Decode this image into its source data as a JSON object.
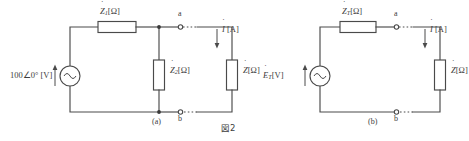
{
  "figure": {
    "caption": "図2",
    "background_color": "#ffffff",
    "line_color": "#4a4a4a",
    "text_color": "#3c3c3c"
  },
  "circuit_a": {
    "sublabel": "(a)",
    "source": {
      "value": "100∠0°",
      "unit": "[V]",
      "symbol": "ac-source",
      "polarity_arrow": "up"
    },
    "series_impedance": {
      "symbol": "Z",
      "subscript": "1",
      "unit": "[Ω]"
    },
    "shunt_impedance": {
      "symbol": "Z",
      "subscript": "2",
      "unit": "[Ω]"
    },
    "load_impedance": {
      "symbol": "Z",
      "subscript": "",
      "unit": "[Ω]"
    },
    "current": {
      "symbol": "I",
      "unit": "[A]",
      "direction": "down"
    },
    "terminals": [
      {
        "name": "a",
        "position": "top"
      },
      {
        "name": "b",
        "position": "bottom"
      }
    ]
  },
  "circuit_b": {
    "sublabel": "(b)",
    "source": {
      "symbol": "E",
      "subscript": "T",
      "unit": "[V]",
      "type": "ac-source",
      "polarity_arrow": "up"
    },
    "series_impedance": {
      "symbol": "Z",
      "subscript": "T",
      "unit": "[Ω]"
    },
    "load_impedance": {
      "symbol": "Z",
      "subscript": "",
      "unit": "[Ω]"
    },
    "current": {
      "symbol": "I",
      "unit": "[A]",
      "direction": "down"
    },
    "terminals": [
      {
        "name": "a",
        "position": "top"
      },
      {
        "name": "b",
        "position": "bottom"
      }
    ]
  }
}
